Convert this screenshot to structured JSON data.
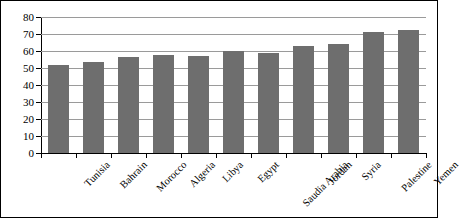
{
  "chart_data": {
    "type": "bar",
    "title": "",
    "subtitle": "",
    "xlabel": "",
    "ylabel": "",
    "categories": [
      "Tunisia",
      "Bahrain",
      "Morocco",
      "Algeria",
      "Libya",
      "Egypt",
      "Saudia Arabia",
      "Jordan",
      "Syria",
      "Palestine",
      "Yemen"
    ],
    "values": [
      51.5,
      53.5,
      56.5,
      57.5,
      57,
      60,
      59,
      63,
      64,
      71,
      72.5
    ],
    "ylim": [
      0,
      80
    ],
    "yticks": [
      0,
      10,
      20,
      30,
      40,
      50,
      60,
      70,
      80
    ],
    "ytick_labels": [
      "0",
      "10",
      "20",
      "30",
      "40",
      "50",
      "60",
      "70",
      "80"
    ],
    "grid": true,
    "legend": null,
    "legend_position": "none",
    "annotations": [],
    "bar_color": "#6e6e6e",
    "gridline_color": "#9a9a9a",
    "axis_color": "#000000",
    "background_color": "#ffffff"
  }
}
